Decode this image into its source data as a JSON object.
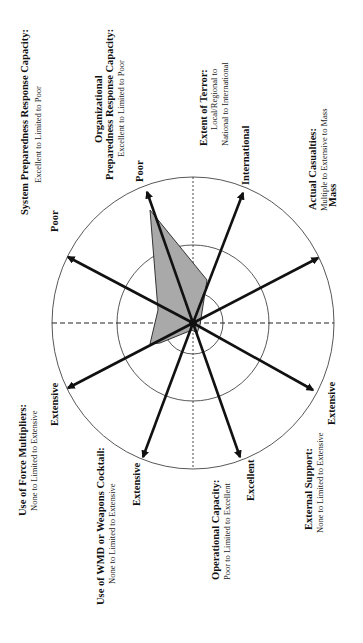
{
  "chart_data": {
    "type": "radar",
    "orientation": "rotated -90deg (text reads bottom-to-top)",
    "center": [
      193,
      323
    ],
    "rings": [
      {
        "name": "inner",
        "rx": 30,
        "ry": 31
      },
      {
        "name": "middle",
        "rx": 76,
        "ry": 78
      },
      {
        "name": "outer",
        "rx": 141,
        "ry": 146
      }
    ],
    "axes": [
      {
        "id": "system",
        "title": "System Preparedness Response Capacity:",
        "subtitle": [
          "Excellent to Limited to Poor"
        ],
        "end_label": "Poor",
        "tip": [
          68,
          257
        ]
      },
      {
        "id": "organizational",
        "title": "Organizational",
        "title2": "Preparedness Response Capacity:",
        "subtitle": [
          "Excellent to Limited to Poor"
        ],
        "end_label": "Poor",
        "tip": [
          147,
          192
        ]
      },
      {
        "id": "terror",
        "title": "Extent of Terror:",
        "subtitle": [
          "Local/Regional to",
          "National to International"
        ],
        "end_label": "International",
        "tip": [
          243,
          193
        ]
      },
      {
        "id": "casualties",
        "title": "Actual Casualties:",
        "subtitle": [
          "Multiple to Extensive to Mass"
        ],
        "end_label": "Mass",
        "tip": [
          318,
          258
        ]
      },
      {
        "id": "external",
        "title": "External Support:",
        "subtitle": [
          "None to Limited to Extensive"
        ],
        "end_label": "Extensive",
        "tip": [
          313,
          390
        ]
      },
      {
        "id": "operational",
        "title": "Operational Capacity:",
        "subtitle": [
          "Poor to Limited to Excellent"
        ],
        "end_label": "Excellent",
        "tip": [
          240,
          457
        ]
      },
      {
        "id": "wmd",
        "title": "Use of WMD or Weapons Cocktail:",
        "subtitle": [
          "None to Limited to Extensive"
        ],
        "end_label": "Extensive",
        "tip": [
          143,
          457
        ]
      },
      {
        "id": "force",
        "title": "Use of Force Multipliers:",
        "subtitle": [
          "None to Limited to Extensive"
        ],
        "end_label": "Extensive",
        "tip": [
          68,
          388
        ]
      }
    ],
    "profile_polygon": [
      [
        150,
        210
      ],
      [
        207,
        280
      ],
      [
        200,
        325
      ],
      [
        197,
        333
      ],
      [
        192,
        330
      ],
      [
        160,
        343
      ],
      [
        150,
        344
      ],
      [
        158,
        310
      ]
    ],
    "profile_fill": "#a9a9a9",
    "grid": "dashed horizontal / dotted vertical axes through center"
  },
  "labels": {
    "system": {
      "title": "System Preparedness Response Capacity:",
      "sub": "Excellent to Limited to Poor",
      "end": "Poor"
    },
    "organizational": {
      "title1": "Organizational",
      "title2": "Preparedness Response Capacity:",
      "sub": "Excellent to Limited to Poor",
      "end": "Poor"
    },
    "terror": {
      "title": "Extent of Terror:",
      "sub1": "Local/Regional to",
      "sub2": "National to International",
      "end": "International"
    },
    "casualties": {
      "title": "Actual Casualties:",
      "sub": "Multiple to Extensive to Mass",
      "end": "Mass"
    },
    "external": {
      "title": "External Support:",
      "sub": "None to Limited to Extensive",
      "end": "Extensive"
    },
    "operational": {
      "title": "Operational Capacity:",
      "sub": "Poor to Limited to Excellent",
      "end": "Excellent"
    },
    "wmd": {
      "title": "Use of WMD or Weapons Cocktail:",
      "sub": "None to Limited to Extensive",
      "end": "Extensive"
    },
    "force": {
      "title": "Use of Force Multipliers:",
      "sub": "None to Limited to Extensive",
      "end": "Extensive"
    }
  }
}
